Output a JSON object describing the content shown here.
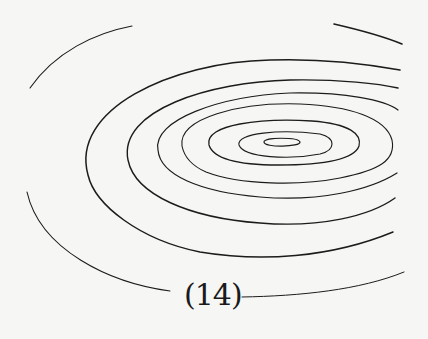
{
  "figure": {
    "caption": "(14)",
    "content": "concentric contour lines",
    "ring_count": 8
  }
}
